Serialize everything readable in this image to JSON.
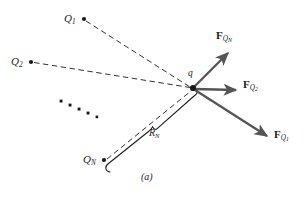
{
  "figure": {
    "caption": "(a)",
    "background_color": "#ffffff",
    "line_color": "#1a1a1a",
    "vector_color": "#555555",
    "width": 307,
    "height": 198
  },
  "charges": [
    {
      "id": "Q1",
      "symbol": "Q",
      "subscript": "1",
      "label": "Q1",
      "point": {
        "x": 84,
        "y": 19
      },
      "label_pos": {
        "x": 64,
        "y": 13
      }
    },
    {
      "id": "Q2",
      "symbol": "Q",
      "subscript": "2",
      "label": "Q2",
      "point": {
        "x": 31,
        "y": 62
      },
      "label_pos": {
        "x": 11,
        "y": 56
      }
    },
    {
      "id": "QN",
      "symbol": "Q",
      "subscript": "N",
      "label": "QN",
      "point": {
        "x": 104,
        "y": 160
      },
      "label_pos": {
        "x": 84,
        "y": 154
      }
    }
  ],
  "test_charge": {
    "symbol": "q",
    "label": "q",
    "point": {
      "x": 193,
      "y": 88
    },
    "label_pos": {
      "x": 188,
      "y": 71
    }
  },
  "ellipsis": {
    "label": "continuation-dots",
    "count": 5,
    "points": [
      {
        "x": 61,
        "y": 101
      },
      {
        "x": 70,
        "y": 105
      },
      {
        "x": 79,
        "y": 109
      },
      {
        "x": 88,
        "y": 113
      },
      {
        "x": 97,
        "y": 117
      }
    ]
  },
  "distance": {
    "symbol": "R",
    "subscript": "N",
    "label": "RN",
    "label_pos": {
      "x": 151,
      "y": 131
    }
  },
  "forces": [
    {
      "id": "FQN",
      "symbol": "F",
      "subscript": "Q",
      "sub_subscript": "N",
      "label": "FQN",
      "from": {
        "x": 193,
        "y": 88
      },
      "to": {
        "x": 231,
        "y": 50
      },
      "label_pos": {
        "x": 217,
        "y": 30
      }
    },
    {
      "id": "FQ2",
      "symbol": "F",
      "subscript": "Q",
      "sub_subscript": "2",
      "label": "FQ2",
      "from": {
        "x": 193,
        "y": 88
      },
      "to": {
        "x": 240,
        "y": 90
      },
      "label_pos": {
        "x": 244,
        "y": 79
      }
    },
    {
      "id": "FQ1",
      "symbol": "F",
      "subscript": "Q",
      "sub_subscript": "1",
      "label": "FQ1",
      "from": {
        "x": 193,
        "y": 88
      },
      "to": {
        "x": 272,
        "y": 139
      },
      "label_pos": {
        "x": 276,
        "y": 130
      }
    }
  ],
  "dashed_lines": [
    {
      "name": "Q1-to-q",
      "from": {
        "x": 84,
        "y": 19
      },
      "to": {
        "x": 193,
        "y": 88
      }
    },
    {
      "name": "Q2-to-q",
      "from": {
        "x": 31,
        "y": 62
      },
      "to": {
        "x": 193,
        "y": 88
      }
    },
    {
      "name": "QN-to-q",
      "from": {
        "x": 104,
        "y": 160
      },
      "to": {
        "x": 193,
        "y": 88
      }
    }
  ],
  "brace": {
    "name": "distance-brace",
    "from": {
      "x": 107,
      "y": 166
    },
    "to": {
      "x": 196,
      "y": 94
    },
    "tip": {
      "x": 152,
      "y": 127
    }
  }
}
